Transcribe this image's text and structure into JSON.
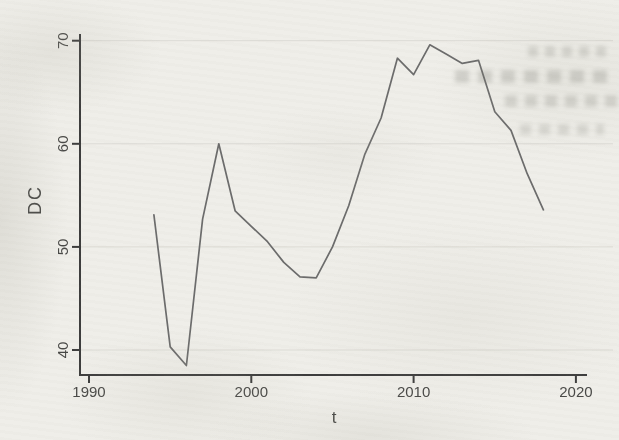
{
  "chart_data": {
    "type": "line",
    "title": "",
    "xlabel": "t",
    "ylabel": "DC",
    "x_ticks": [
      1990,
      2000,
      2010,
      2020
    ],
    "y_ticks": [
      40,
      50,
      60,
      70
    ],
    "xlim": [
      1989.4,
      2022.2
    ],
    "ylim": [
      37.5,
      70.8
    ],
    "grid": "horizontal-only",
    "legend": "none",
    "series": [
      {
        "name": "DC",
        "x": [
          1994,
          1995,
          1996,
          1997,
          1998,
          1999,
          2000,
          2001,
          2002,
          2003,
          2004,
          2005,
          2006,
          2007,
          2008,
          2009,
          2010,
          2011,
          2012,
          2013,
          2014,
          2015,
          2016,
          2017,
          2018
        ],
        "values": [
          53.1,
          40.3,
          38.5,
          52.7,
          60.0,
          53.5,
          52.0,
          50.5,
          48.5,
          47.1,
          47.0,
          50.0,
          54.0,
          59.0,
          62.5,
          68.3,
          66.7,
          69.6,
          68.7,
          67.8,
          68.1,
          63.1,
          61.3,
          57.1,
          53.6
        ]
      }
    ],
    "colors": {
      "line": "#6b6b6b",
      "axis": "#3c3c3c",
      "gridline": "#dcdbd5",
      "label": "#484846",
      "background": "#efeee9"
    }
  }
}
